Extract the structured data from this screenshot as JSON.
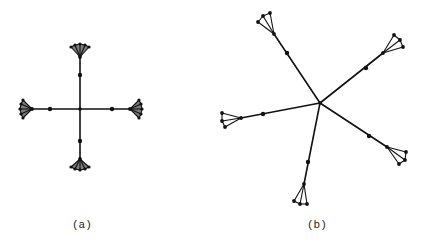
{
  "figure": {
    "panels": [
      {
        "id": "a",
        "caption": "(a)",
        "description": "Cross-shaped tree: central hub with 4 arms, each arm has one intermediate node and ends in a dense fan (star) of leaves",
        "center": [
          80,
          109
        ],
        "arms": [
          {
            "dir": "up",
            "mid": [
              80,
              75
            ],
            "apex": [
              80,
              57
            ],
            "fan": [
              [
                71,
                47
              ],
              [
                75,
                45
              ],
              [
                80,
                44
              ],
              [
                85,
                45
              ],
              [
                89,
                47
              ]
            ]
          },
          {
            "dir": "down",
            "mid": [
              80,
              141
            ],
            "apex": [
              80,
              159
            ],
            "fan": [
              [
                71,
                167
              ],
              [
                75,
                169
              ],
              [
                80,
                170
              ],
              [
                85,
                169
              ],
              [
                89,
                167
              ]
            ]
          },
          {
            "dir": "left",
            "mid": [
              50,
              109
            ],
            "apex": [
              32,
              109
            ],
            "fan": [
              [
                23,
                100
              ],
              [
                21,
                104
              ],
              [
                20,
                109
              ],
              [
                21,
                114
              ],
              [
                23,
                118
              ]
            ]
          },
          {
            "dir": "right",
            "mid": [
              112,
              109
            ],
            "apex": [
              130,
              109
            ],
            "fan": [
              [
                139,
                100
              ],
              [
                141,
                104
              ],
              [
                142,
                109
              ],
              [
                141,
                114
              ],
              [
                139,
                118
              ]
            ]
          }
        ]
      },
      {
        "id": "b",
        "caption": "(b)",
        "description": "Five-armed star tree: central hub with 5 arms at irregular angles, each with one intermediate node and ending in a small triangular fan of 3 leaves",
        "center": [
          320,
          103
        ],
        "arms": [
          {
            "dir": "upper-left",
            "mid": [
              287,
              53
            ],
            "apex": [
              274,
              34
            ],
            "fan": [
              [
                258,
                22
              ],
              [
                263,
                16
              ],
              [
                270,
                13
              ]
            ]
          },
          {
            "dir": "upper-right",
            "mid": [
              366,
              68
            ],
            "apex": [
              383,
              53
            ],
            "fan": [
              [
                394,
                35
              ],
              [
                400,
                40
              ],
              [
                403,
                47
              ]
            ]
          },
          {
            "dir": "left",
            "mid": [
              263,
              114
            ],
            "apex": [
              241,
              118
            ],
            "fan": [
              [
                222,
                113
              ],
              [
                222,
                121
              ],
              [
                225,
                127
              ]
            ]
          },
          {
            "dir": "lower-right",
            "mid": [
              369,
              136
            ],
            "apex": [
              387,
              147
            ],
            "fan": [
              [
                406,
                152
              ],
              [
                405,
                160
              ],
              [
                399,
                164
              ]
            ]
          },
          {
            "dir": "bottom",
            "mid": [
              308,
              162
            ],
            "apex": [
              304,
              184
            ],
            "fan": [
              [
                294,
                201
              ],
              [
                300,
                204
              ],
              [
                307,
                204
              ]
            ]
          }
        ]
      }
    ],
    "colors": {
      "ink": "#111111",
      "background": "#ffffff"
    }
  }
}
